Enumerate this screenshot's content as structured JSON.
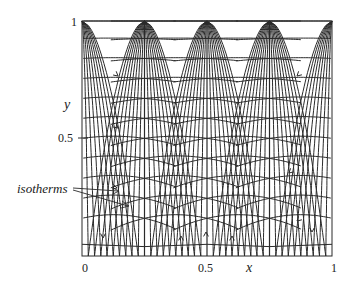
{
  "figure": {
    "type": "flow-field-diagram",
    "axes": {
      "x_label": "x",
      "y_label": "y",
      "x_ticks": [
        "0",
        "0.5",
        "1"
      ],
      "y_ticks": [
        "0.5",
        "1"
      ],
      "x_range": [
        0,
        1
      ],
      "y_range": [
        0,
        1
      ]
    },
    "annotation": {
      "label": "isotherms"
    },
    "separatrices_x": [
      0.25,
      0.5,
      0.75
    ],
    "colors": {
      "line": "#2a2a2a",
      "background": "#ffffff"
    }
  }
}
